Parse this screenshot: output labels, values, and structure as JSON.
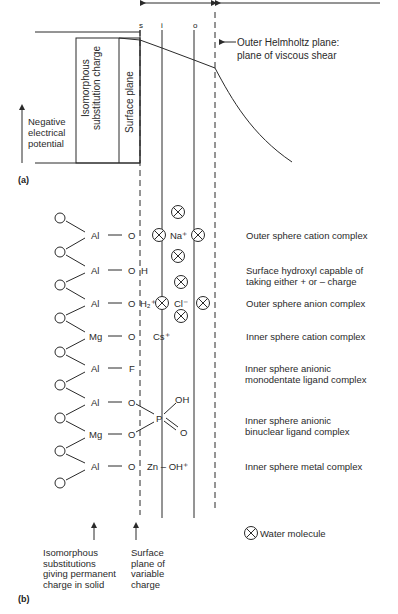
{
  "panel_a": {
    "label": "(a)",
    "plane_markers": [
      "s",
      "i",
      "o"
    ],
    "axis_label": [
      "Negative",
      "electrical",
      "potential"
    ],
    "box_labels": {
      "isomorphous": [
        "Isomorphous",
        "substitution charge"
      ],
      "surface": "Surface plane"
    },
    "ohp_annotation": [
      "Outer Helmholtz plane:",
      "plane of viscous shear"
    ]
  },
  "panel_b": {
    "label": "(b)",
    "rows": [
      {
        "metal": "Al",
        "ligand": "O",
        "ligand_suffix": "-",
        "desc": [
          "Outer sphere cation complex"
        ]
      },
      {
        "metal": "Al",
        "ligand": "O",
        "ligand_suffix": "H",
        "desc": [
          "Surface hydroxyl capable of",
          "taking either  +  or  –  charge"
        ]
      },
      {
        "metal": "Al",
        "ligand": "O",
        "ligand_suffix": "H₂⁺",
        "desc": [
          "Outer sphere anion complex"
        ]
      },
      {
        "metal": "Mg",
        "ligand": "O",
        "ligand_suffix": "-",
        "desc": [
          "Inner sphere cation complex"
        ]
      },
      {
        "metal": "Al",
        "ligand": "F",
        "ligand_suffix": "",
        "desc": [
          "Inner sphere anionic",
          "monodentate ligand complex"
        ]
      },
      {
        "metal": "Al",
        "ligand": "O",
        "ligand_suffix": "",
        "desc": [
          "Inner sphere anionic",
          "binuclear ligand complex"
        ]
      },
      {
        "metal": "Mg",
        "ligand": "O",
        "ligand_suffix": "",
        "desc": []
      },
      {
        "metal": "Al",
        "ligand": "O",
        "ligand_suffix": "-",
        "desc": [
          "Inner sphere metal complex"
        ]
      }
    ],
    "ions": {
      "na": "Na⁺",
      "cl": "Cl⁻",
      "cs": "Cs⁺",
      "p": "P",
      "p_oh": "OH",
      "p_o": "O",
      "zn": "Zn – OH⁺"
    },
    "legend": {
      "icon": "water-molecule-icon",
      "text": "Water molecule"
    },
    "bottom_labels": {
      "isomorphous": [
        "Isomorphous",
        "substitutions",
        "giving permanent",
        "charge in solid"
      ],
      "surface": [
        "Surface",
        "plane of",
        "variable",
        "charge"
      ]
    }
  },
  "colors": {
    "ink": "#2a2a2a",
    "background": "#ffffff"
  }
}
